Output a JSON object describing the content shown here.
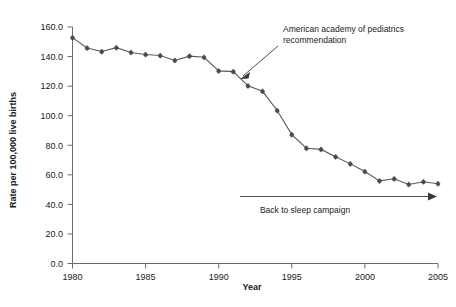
{
  "chart_data": {
    "type": "line",
    "title": "",
    "xlabel": "Year",
    "ylabel": "Rate per 100,000 live births",
    "xlim": [
      1980,
      2005
    ],
    "ylim": [
      0,
      160
    ],
    "grid": false,
    "legend": "none",
    "x": [
      1980,
      1981,
      1982,
      1983,
      1984,
      1985,
      1986,
      1987,
      1988,
      1989,
      1990,
      1991,
      1992,
      1993,
      1994,
      1995,
      1996,
      1997,
      1998,
      1999,
      2000,
      2001,
      2002,
      2003,
      2004,
      2005
    ],
    "values": [
      152.8,
      145.8,
      143.4,
      146.0,
      142.8,
      141.4,
      140.7,
      137.4,
      140.3,
      139.5,
      130.3,
      129.8,
      120.2,
      116.5,
      103.5,
      87.2,
      78.0,
      77.2,
      72.2,
      67.4,
      62.2,
      55.9,
      57.3,
      53.5,
      55.3,
      54.0
    ],
    "series": [
      {
        "name": "SIDS rate",
        "values": [
          152.8,
          145.8,
          143.4,
          146.0,
          142.8,
          141.4,
          140.7,
          137.4,
          140.3,
          139.5,
          130.3,
          129.8,
          120.2,
          116.5,
          103.5,
          87.2,
          78.0,
          77.2,
          72.2,
          67.4,
          62.2,
          55.9,
          57.3,
          53.5,
          55.3,
          54.0
        ]
      }
    ],
    "xticks": [
      1980,
      1985,
      1990,
      1995,
      2000,
      2005
    ],
    "xtick_labels": [
      "1980",
      "1985",
      "1990",
      "1995",
      "2000",
      "2005"
    ],
    "yticks": [
      0,
      20,
      40,
      60,
      80,
      100,
      120,
      140,
      160
    ],
    "ytick_labels": [
      "0.0",
      "20.0",
      "40.0",
      "60.0",
      "80.0",
      "100.0",
      "120.0",
      "140.0",
      "160.0"
    ],
    "annotations": [
      {
        "id": "aap-recommendation",
        "text_line1": "American academy of pediatrics",
        "text_line2": "recommendation",
        "arrow_from_x": 1995.2,
        "arrow_to_x": 1993.4,
        "points_to_year": 1993
      },
      {
        "id": "back-to-sleep",
        "text": "Back to sleep campaign",
        "span_from_year": 1994,
        "span_to_year": 2005,
        "level": 44
      }
    ],
    "marker_color": "#4a4a4a",
    "line_color": "#5a5a5a",
    "axis_color": "#6b6b6b",
    "text_color": "#1a1a1a",
    "background": "#ffffff"
  }
}
